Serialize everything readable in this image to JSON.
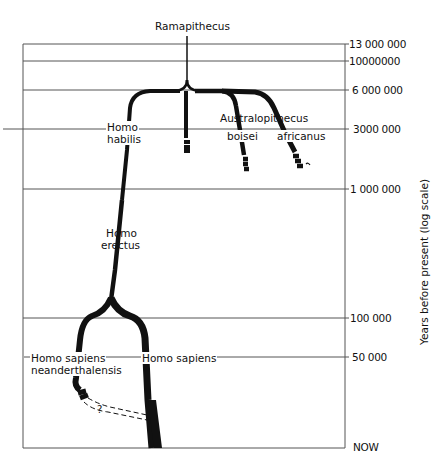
{
  "diagram": {
    "title_node": "Ramapithecus",
    "y_axis_label": "Years before present  (log scale)",
    "time_ticks": [
      {
        "label": "13 000 000",
        "y": 44
      },
      {
        "label": "10000000",
        "y": 61
      },
      {
        "label": "6 000 000",
        "y": 90
      },
      {
        "label": "3000 000",
        "y": 129
      },
      {
        "label": "1 000 000",
        "y": 189
      },
      {
        "label": "100 000",
        "y": 318
      },
      {
        "label": "50 000",
        "y": 357
      },
      {
        "label": "NOW",
        "y": 448
      }
    ],
    "taxa": {
      "homo_habilis_1": "Homo",
      "homo_habilis_2": "habilis",
      "australopithecus": "Australopithecus",
      "boisei": "boisei",
      "africanus": "africanus",
      "homo_erectus_1": "Homo",
      "homo_erectus_2": "erectus",
      "neanderthal_1": "Homo sapiens",
      "neanderthal_2": "neanderthalensis",
      "homo_sapiens": "Homo sapiens",
      "uncertain_link": "?"
    },
    "colors": {
      "ink": "#111111",
      "line": "#555555",
      "background": "#ffffff"
    }
  }
}
